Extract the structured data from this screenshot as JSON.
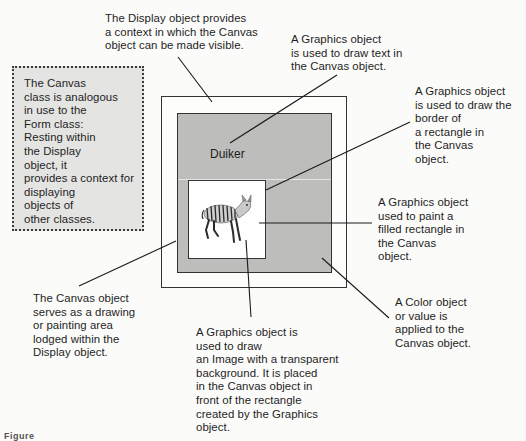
{
  "diagram": {
    "type": "annotated-figure",
    "boxes": {
      "display": {
        "name": "Display object",
        "fill": "#fdfdfc",
        "border": "#333333"
      },
      "canvas": {
        "name": "Canvas object",
        "fill": "#bdbdbb",
        "border": "#333333"
      },
      "rectangle": {
        "name": "Filled rectangle",
        "fill": "#fefefe",
        "border": "#333333"
      }
    },
    "canvas_text": "Duiker",
    "image": {
      "name": "duiker-image",
      "description": "striped antelope drawn with transparent background"
    },
    "note_box": {
      "style": "dotted",
      "fill": "#e4e4e2",
      "text": "The Canvas\nclass is analogous\nin use to the\nForm class:\nResting within\nthe Display\nobject, it\nprovides a context for\ndisplaying\nobjects of\nother classes."
    },
    "callouts": [
      {
        "id": "display-context",
        "text": "The Display object provides\na context in which the Canvas\nobject can be made visible."
      },
      {
        "id": "graphics-text",
        "text": "A Graphics object\nis used to draw text in\nthe Canvas object."
      },
      {
        "id": "graphics-border",
        "text": "A Graphics object\nis used to draw the\nborder of\na rectangle in\nthe Canvas\nobject."
      },
      {
        "id": "graphics-fill",
        "text": "A Graphics object\nused to paint a\nfilled rectangle in\nthe Canvas\nobject."
      },
      {
        "id": "color-object",
        "text": "A Color object\nor value is\napplied to the\nCanvas object."
      },
      {
        "id": "canvas-area",
        "text": "The Canvas object\nserves as a drawing\nor painting area\nlodged within the\nDisplay object."
      },
      {
        "id": "graphics-image",
        "text": "A Graphics object is\nused to draw\nan Image with a transparent\nbackground. It is placed\nin the Canvas object in\nfront of the rectangle\ncreated by the Graphics\nobject."
      }
    ],
    "caption": "Figure"
  }
}
